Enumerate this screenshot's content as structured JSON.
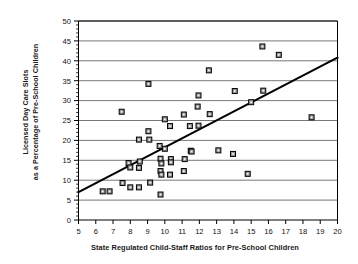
{
  "chart_data": {
    "type": "scatter",
    "title": "",
    "xlabel": "State Regulated Child-Staff Ratios for Pre-School Children",
    "ylabel_line1": "Licensed Day Care Slots",
    "ylabel_line2": "as a Percentage of Pre-School Children",
    "xlim": [
      5,
      20
    ],
    "ylim": [
      0,
      50
    ],
    "xticks": [
      5,
      6,
      7,
      8,
      9,
      10,
      11,
      12,
      13,
      14,
      15,
      16,
      17,
      18,
      19,
      20
    ],
    "yticks": [
      0,
      5,
      10,
      15,
      20,
      25,
      30,
      35,
      40,
      45,
      50
    ],
    "xtick_labels": [
      "5",
      "6",
      "7",
      "8",
      "9",
      "10",
      "11",
      "12",
      "13",
      "14",
      "15",
      "16",
      "17",
      "18",
      "19",
      "20"
    ],
    "ytick_labels": [
      "0",
      "5",
      "10",
      "15",
      "20",
      "25",
      "30",
      "35",
      "40",
      "45",
      "50"
    ],
    "y_minor_tick_step": 1,
    "grid": "horizontal-major",
    "grid_color": "#555555",
    "legend": "none",
    "marker": "square",
    "marker_fill": "#999999",
    "marker_edge": "#000000",
    "trendline": {
      "label": "linear fit",
      "x_start": 5,
      "y_start": 7.0,
      "x_end": 20,
      "y_end": 40.8,
      "color": "#000000"
    },
    "points": [
      {
        "x": 6.4,
        "y": 7.2
      },
      {
        "x": 6.8,
        "y": 7.2
      },
      {
        "x": 7.5,
        "y": 27.2
      },
      {
        "x": 7.55,
        "y": 9.3
      },
      {
        "x": 7.9,
        "y": 14.3
      },
      {
        "x": 8.0,
        "y": 13.2
      },
      {
        "x": 8.0,
        "y": 8.2
      },
      {
        "x": 8.5,
        "y": 20.2
      },
      {
        "x": 8.55,
        "y": 14.7
      },
      {
        "x": 8.5,
        "y": 13.1
      },
      {
        "x": 8.5,
        "y": 8.2
      },
      {
        "x": 9.05,
        "y": 34.2
      },
      {
        "x": 9.05,
        "y": 22.3
      },
      {
        "x": 9.1,
        "y": 20.2
      },
      {
        "x": 9.15,
        "y": 9.4
      },
      {
        "x": 9.7,
        "y": 18.6
      },
      {
        "x": 9.75,
        "y": 15.4
      },
      {
        "x": 9.8,
        "y": 14.2
      },
      {
        "x": 9.75,
        "y": 12.3
      },
      {
        "x": 9.8,
        "y": 11.4
      },
      {
        "x": 9.75,
        "y": 6.4
      },
      {
        "x": 10.0,
        "y": 25.3
      },
      {
        "x": 10.0,
        "y": 17.9
      },
      {
        "x": 10.3,
        "y": 23.6
      },
      {
        "x": 10.35,
        "y": 15.3
      },
      {
        "x": 10.35,
        "y": 14.5
      },
      {
        "x": 10.3,
        "y": 11.4
      },
      {
        "x": 11.1,
        "y": 26.5
      },
      {
        "x": 11.15,
        "y": 15.3
      },
      {
        "x": 11.1,
        "y": 12.3
      },
      {
        "x": 11.45,
        "y": 23.6
      },
      {
        "x": 11.5,
        "y": 17.4
      },
      {
        "x": 11.55,
        "y": 17.2
      },
      {
        "x": 11.95,
        "y": 31.3
      },
      {
        "x": 11.9,
        "y": 28.5
      },
      {
        "x": 11.95,
        "y": 23.7
      },
      {
        "x": 12.55,
        "y": 37.6
      },
      {
        "x": 12.6,
        "y": 26.6
      },
      {
        "x": 13.1,
        "y": 17.5
      },
      {
        "x": 13.95,
        "y": 16.6
      },
      {
        "x": 14.05,
        "y": 32.4
      },
      {
        "x": 14.8,
        "y": 11.6
      },
      {
        "x": 15.0,
        "y": 29.6
      },
      {
        "x": 15.65,
        "y": 43.6
      },
      {
        "x": 15.7,
        "y": 32.5
      },
      {
        "x": 16.6,
        "y": 41.5
      },
      {
        "x": 18.5,
        "y": 25.8
      }
    ]
  }
}
